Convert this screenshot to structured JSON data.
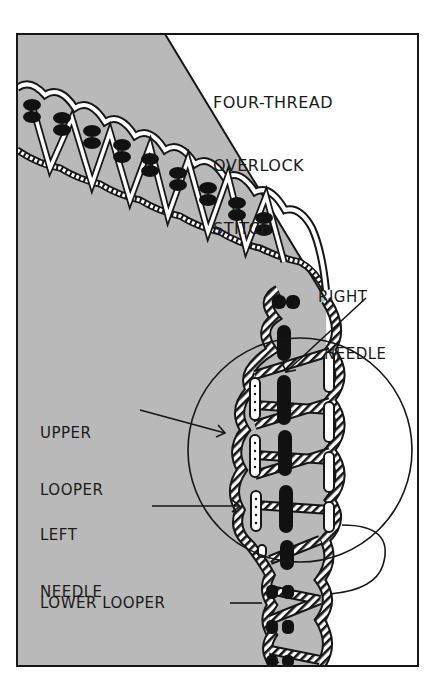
{
  "title": {
    "lines": [
      "FOUR-THREAD",
      "OVERLOCK",
      "STITCH"
    ]
  },
  "labels": {
    "right_needle": [
      "RIGHT",
      "NEEDLE"
    ],
    "upper_looper": [
      "UPPER",
      "LOOPER"
    ],
    "left_needle": [
      "LEFT",
      "NEEDLE"
    ],
    "lower_looper": "LOWER LOOPER"
  },
  "colors": {
    "fabric": "#b9b9b9",
    "ink": "#161616",
    "paper": "#ffffff",
    "needle_thread": "#111111",
    "looper_thread": "#ffffff"
  }
}
